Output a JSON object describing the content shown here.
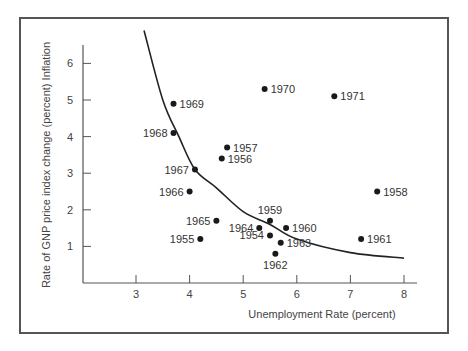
{
  "chart_data": {
    "type": "scatter",
    "title": "",
    "xlabel": "Unemployment Rate (percent)",
    "ylabel": "Rate of GNP price index change (percent) Inflation",
    "xlim": [
      2,
      8.3
    ],
    "ylim": [
      0,
      6.5
    ],
    "x_ticks": [
      3,
      4,
      5,
      6,
      7,
      8
    ],
    "y_ticks": [
      1,
      2,
      3,
      4,
      5,
      6
    ],
    "grid": false,
    "legend": null,
    "points": [
      {
        "label": "1954",
        "x": 5.5,
        "y": 1.3,
        "label_pos": "left"
      },
      {
        "label": "1955",
        "x": 4.2,
        "y": 1.2,
        "label_pos": "left"
      },
      {
        "label": "1956",
        "x": 4.6,
        "y": 3.4,
        "label_pos": "right"
      },
      {
        "label": "1957",
        "x": 4.7,
        "y": 3.7,
        "label_pos": "right"
      },
      {
        "label": "1958",
        "x": 7.5,
        "y": 2.5,
        "label_pos": "right"
      },
      {
        "label": "1959",
        "x": 5.5,
        "y": 1.7,
        "label_pos": "top"
      },
      {
        "label": "1960",
        "x": 5.8,
        "y": 1.5,
        "label_pos": "right"
      },
      {
        "label": "1961",
        "x": 7.2,
        "y": 1.2,
        "label_pos": "right"
      },
      {
        "label": "1962",
        "x": 5.6,
        "y": 0.8,
        "label_pos": "bottom"
      },
      {
        "label": "1963",
        "x": 5.7,
        "y": 1.1,
        "label_pos": "right"
      },
      {
        "label": "1964",
        "x": 5.3,
        "y": 1.5,
        "label_pos": "left"
      },
      {
        "label": "1965",
        "x": 4.5,
        "y": 1.7,
        "label_pos": "left"
      },
      {
        "label": "1966",
        "x": 4.0,
        "y": 2.5,
        "label_pos": "left"
      },
      {
        "label": "1967",
        "x": 4.1,
        "y": 3.1,
        "label_pos": "left"
      },
      {
        "label": "1968",
        "x": 3.7,
        "y": 4.1,
        "label_pos": "left"
      },
      {
        "label": "1969",
        "x": 3.7,
        "y": 4.9,
        "label_pos": "right"
      },
      {
        "label": "1970",
        "x": 5.4,
        "y": 5.3,
        "label_pos": "right"
      },
      {
        "label": "1971",
        "x": 6.7,
        "y": 5.1,
        "label_pos": "right"
      }
    ],
    "curve": {
      "name": "Phillips curve (fitted)",
      "points": [
        [
          3.15,
          6.9
        ],
        [
          3.5,
          5.0
        ],
        [
          3.8,
          4.0
        ],
        [
          4.1,
          3.1
        ],
        [
          4.5,
          2.6
        ],
        [
          5.0,
          1.95
        ],
        [
          5.5,
          1.6
        ],
        [
          6.0,
          1.2
        ],
        [
          7.0,
          0.83
        ],
        [
          8.0,
          0.68
        ]
      ]
    }
  },
  "mapping": {
    "x0_px": 136,
    "x_per_unit": 53.6,
    "x0_val": 3,
    "y0_px": 283,
    "y_per_unit": 36.6,
    "axis_x_px": 83,
    "axis_right_px": 417,
    "axis_top_px": 45
  }
}
